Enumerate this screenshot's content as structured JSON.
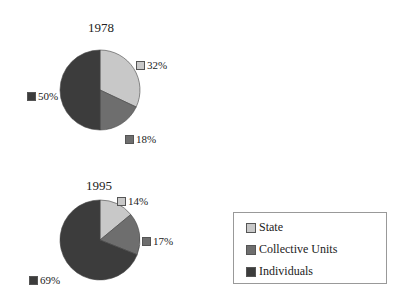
{
  "colors": {
    "State": "#c8c8c8",
    "Collective Units": "#6e6e6e",
    "Individuals": "#3c3c3c"
  },
  "legend": {
    "items": [
      "State",
      "Collective Units",
      "Individuals"
    ]
  },
  "pies": [
    {
      "title": "1978",
      "labels": {
        "state": "32%",
        "collective": "18%",
        "individuals": "50%"
      }
    },
    {
      "title": "1995",
      "labels": {
        "state": "14%",
        "collective": "17%",
        "individuals": "69%"
      }
    }
  ],
  "chart_data": [
    {
      "type": "pie",
      "title": "1978",
      "categories": [
        "State",
        "Collective Units",
        "Individuals"
      ],
      "values": [
        32,
        18,
        50
      ],
      "legend_position": "bottom-right"
    },
    {
      "type": "pie",
      "title": "1995",
      "categories": [
        "State",
        "Collective Units",
        "Individuals"
      ],
      "values": [
        14,
        17,
        69
      ],
      "legend_position": "bottom-right"
    }
  ]
}
